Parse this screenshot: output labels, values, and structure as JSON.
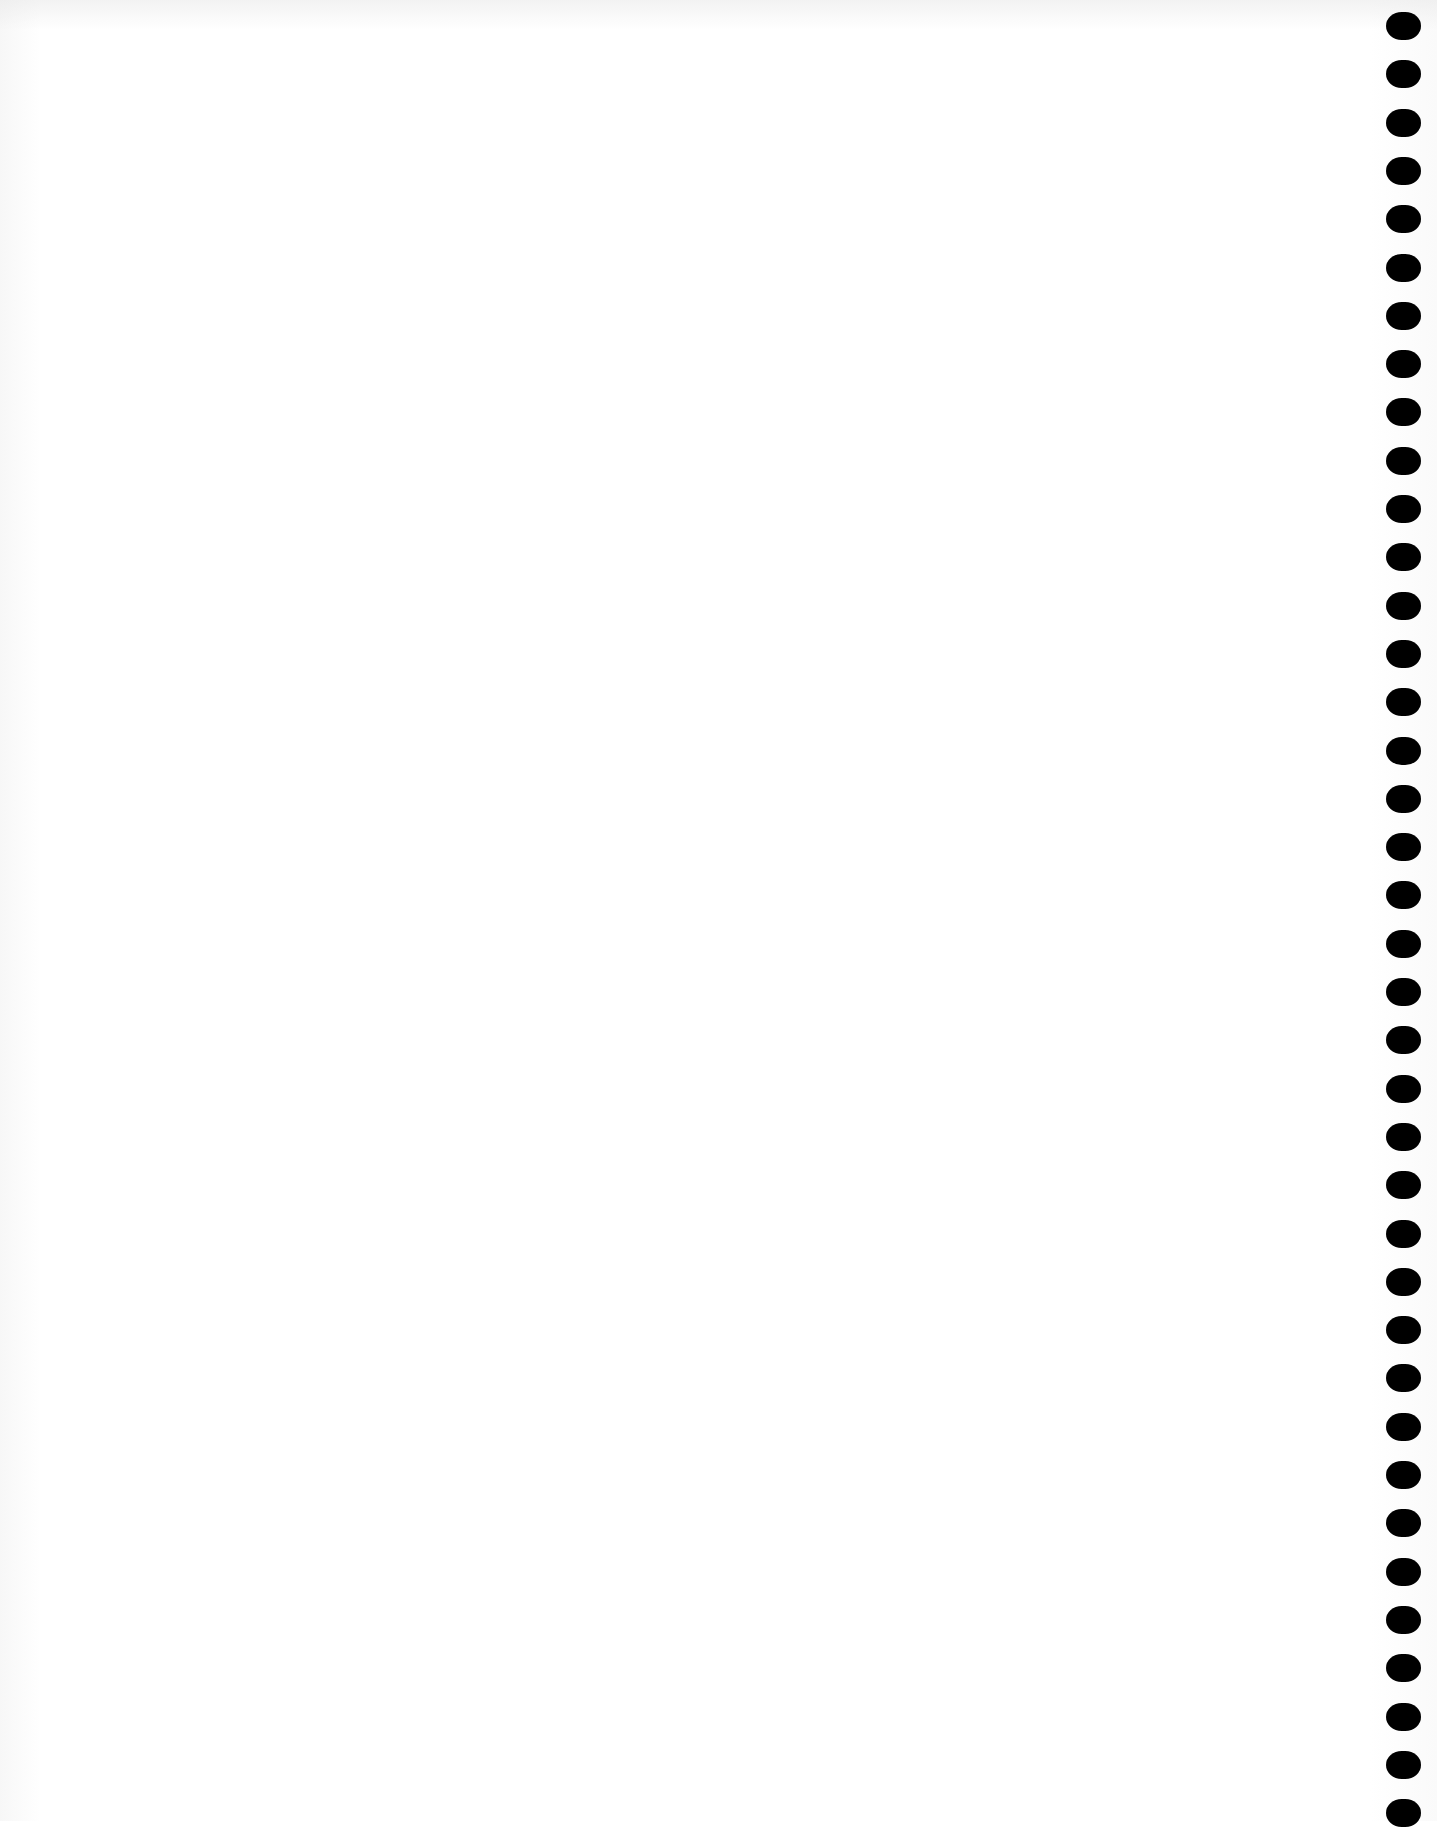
{
  "document": {
    "type": "blank scanned page",
    "text_content": "",
    "background_color": "#ffffff"
  },
  "binding": {
    "side": "right",
    "hole_count": 38,
    "hole_color": "#000000",
    "first_hole_top_px": 12,
    "spacing_px": 48.3
  }
}
